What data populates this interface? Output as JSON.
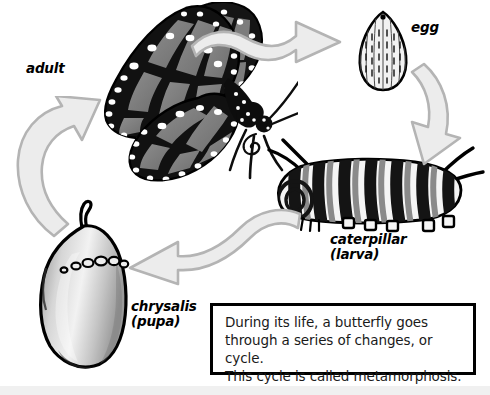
{
  "diagram": {
    "background_color": "#ffffff",
    "ink_color": "#000000",
    "arrow_fill_color": "#ececec",
    "arrow_stroke_color": "#b4b4b4"
  },
  "labels": {
    "adult": "adult",
    "egg": "egg",
    "caterpillar": "caterpillar\n(larva)",
    "chrysalis": "chrysalis\n(pupa)"
  },
  "stages": [
    {
      "id": "adult",
      "label": "adult",
      "order": 1
    },
    {
      "id": "egg",
      "label": "egg",
      "order": 2
    },
    {
      "id": "caterpillar",
      "label": "caterpillar (larva)",
      "order": 3
    },
    {
      "id": "chrysalis",
      "label": "chrysalis (pupa)",
      "order": 4
    }
  ],
  "arrows": [
    {
      "id": "adult-to-egg",
      "from": "adult",
      "to": "egg",
      "direction": "right",
      "shape": "s-curve"
    },
    {
      "id": "egg-to-caterpillar",
      "from": "egg",
      "to": "caterpillar",
      "direction": "down-left",
      "shape": "curve"
    },
    {
      "id": "caterpillar-to-chrysalis",
      "from": "caterpillar",
      "to": "chrysalis",
      "direction": "left",
      "shape": "s-curve"
    },
    {
      "id": "chrysalis-to-adult",
      "from": "chrysalis",
      "to": "adult",
      "direction": "up-right",
      "shape": "curve"
    }
  ],
  "caption": {
    "text": "During its life, a butterfly goes\nthrough a series of changes, or cycle.\nThis cycle is called metamorphosis."
  }
}
